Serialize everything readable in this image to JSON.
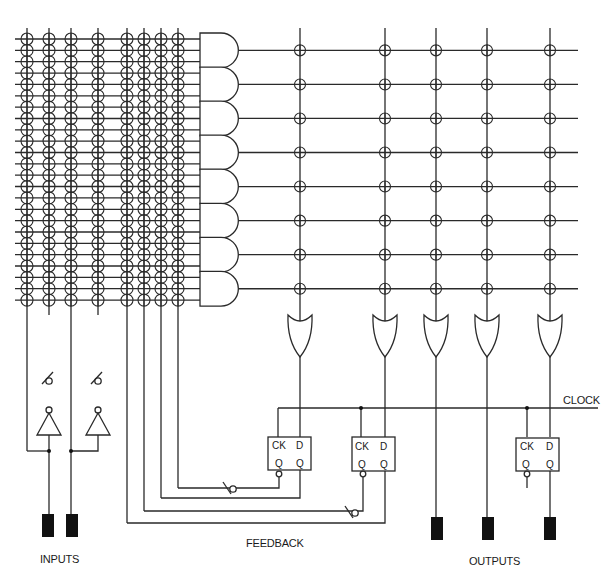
{
  "diagram": {
    "type": "PAL / PLD architecture schematic",
    "stroke_color": "#2a2a2a",
    "pin_color": "#111111",
    "labels": {
      "inputs": "INPUTS",
      "feedback": "FEEDBACK",
      "outputs": "OUTPUTS",
      "clock": "CLOCK"
    },
    "and_array": {
      "input_columns": 8,
      "product_term_rows": 24,
      "and_gates": 8,
      "inputs_per_and_gate": 3
    },
    "or_array": {
      "or_gates": 5,
      "connections_per_or_gate": 8
    },
    "flip_flops": [
      {
        "id": "ff1",
        "pins": {
          "ck": "CK",
          "d": "D",
          "q": "Q",
          "qbar": "Q"
        }
      },
      {
        "id": "ff2",
        "pins": {
          "ck": "CK",
          "d": "D",
          "q": "Q",
          "qbar": "Q"
        }
      },
      {
        "id": "ff3",
        "pins": {
          "ck": "CK",
          "d": "D",
          "q": "Q",
          "qbar": "Q"
        }
      }
    ],
    "input_pins": 2,
    "output_pins": 3,
    "inverters": 2
  }
}
